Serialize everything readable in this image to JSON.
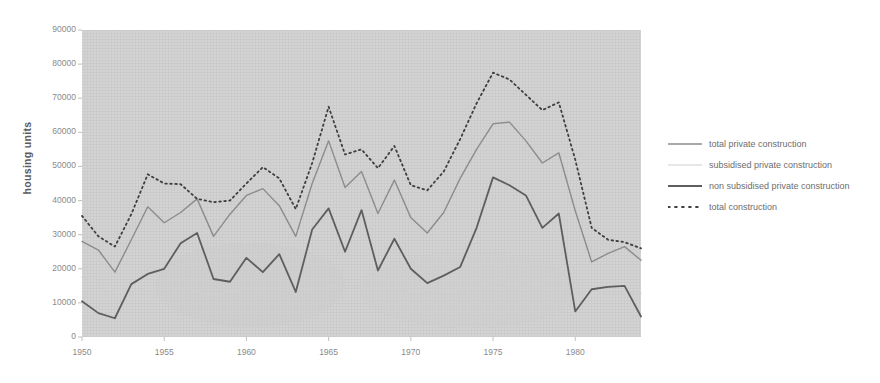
{
  "chart_data": {
    "type": "line",
    "title": "",
    "xlabel": "",
    "ylabel": "housing units",
    "xlim": [
      1950,
      1984
    ],
    "ylim": [
      0,
      90000
    ],
    "grid": false,
    "legend_position": "right",
    "x": [
      1950,
      1951,
      1952,
      1953,
      1954,
      1955,
      1956,
      1957,
      1958,
      1959,
      1960,
      1961,
      1962,
      1963,
      1964,
      1965,
      1966,
      1967,
      1968,
      1969,
      1970,
      1971,
      1972,
      1973,
      1974,
      1975,
      1976,
      1977,
      1978,
      1979,
      1980,
      1981,
      1982,
      1983,
      1984
    ],
    "xticks": [
      1950,
      1955,
      1960,
      1965,
      1970,
      1975,
      1980
    ],
    "xticklabels": [
      "1950",
      "1955",
      "1960",
      "1965",
      "1970",
      "1975",
      "1980"
    ],
    "yticks": [
      0,
      10000,
      20000,
      30000,
      40000,
      50000,
      60000,
      70000,
      80000,
      90000
    ],
    "yticklabels": [
      "0",
      "10000",
      "20000",
      "30000",
      "40000",
      "50000",
      "60000",
      "70000",
      "80000",
      "90000"
    ],
    "series": [
      {
        "name": "total private construction",
        "color": "#8c8c8c",
        "style": "solid",
        "width": 1.4,
        "values": [
          28000,
          25500,
          19000,
          28500,
          38200,
          33500,
          36500,
          40500,
          29500,
          36000,
          41500,
          43500,
          38500,
          29500,
          45000,
          57500,
          43800,
          48500,
          36200,
          46000,
          35000,
          30500,
          36500,
          46500,
          55000,
          62500,
          63000,
          57500,
          51000,
          54000,
          37000,
          22000,
          24500,
          26500,
          22500
        ]
      },
      {
        "name": "subsidised private construction",
        "color": "#cfcfcf",
        "style": "solid",
        "width": 1.2,
        "values": [
          17500,
          16500,
          13500,
          13000,
          14300,
          13700,
          14500,
          13000,
          12500,
          13300,
          13700,
          14500,
          14800,
          14000,
          14300,
          15000,
          14800,
          14500,
          14200,
          14000,
          13500,
          13000,
          13200,
          13800,
          14500,
          15800,
          16200,
          15500,
          14800,
          14500,
          13200,
          12500,
          12800,
          13200,
          12800
        ]
      },
      {
        "name": "non subsidised private construction",
        "color": "#5e5e5e",
        "style": "solid",
        "width": 1.8,
        "values": [
          10500,
          7000,
          5500,
          15500,
          18500,
          20000,
          27500,
          30500,
          17000,
          16200,
          23200,
          19000,
          24300,
          13200,
          31500,
          37700,
          25000,
          37200,
          19500,
          28800,
          20000,
          15800,
          18000,
          20500,
          32000,
          46800,
          44500,
          41500,
          32000,
          36200,
          7500,
          14000,
          14700,
          15000,
          6000
        ]
      },
      {
        "name": "total construction",
        "color": "#3f3f3f",
        "style": "dotted",
        "width": 1.8,
        "values": [
          35500,
          29500,
          26500,
          36000,
          47700,
          45000,
          44800,
          40500,
          39500,
          40000,
          45000,
          49800,
          46500,
          37500,
          51000,
          67500,
          53500,
          55000,
          49500,
          56000,
          44500,
          43000,
          48500,
          58000,
          68500,
          77500,
          75500,
          71000,
          66500,
          68800,
          52000,
          32000,
          28500,
          27800,
          26000
        ]
      }
    ]
  },
  "axis": {
    "ylabel": "housing units"
  },
  "legend": {
    "items": [
      {
        "label": "total private construction",
        "swatch": "solid-line-medium-gray"
      },
      {
        "label": "subsidised private construction",
        "swatch": "solid-line-light-gray"
      },
      {
        "label": "non subsidised private construction",
        "swatch": "solid-line-dark-gray"
      },
      {
        "label": "total construction",
        "swatch": "dotted-line-dark"
      }
    ]
  },
  "colors": {
    "plot_background": "#d4d4d4",
    "page_background": "#ffffff",
    "tick_text": "#8a8a8a",
    "axis_title": "#5b5b5b",
    "legend_text": "#6d6d6d"
  }
}
